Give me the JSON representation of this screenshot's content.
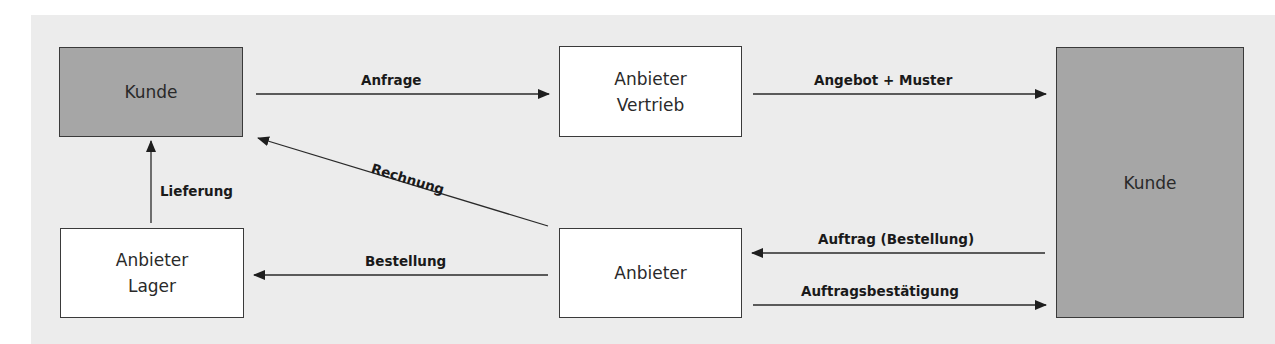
{
  "nodes": {
    "kunde_top_left": "Kunde",
    "anbieter_vertrieb": "Anbieter\nVertrieb",
    "kunde_right": "Kunde",
    "anbieter_lager": "Anbieter\nLager",
    "anbieter": "Anbieter"
  },
  "edges": {
    "anfrage": "Anfrage",
    "angebot_muster": "Angebot + Muster",
    "rechnung": "Rechnung",
    "lieferung": "Lieferung",
    "bestellung": "Bestellung",
    "auftrag": "Auftrag (Bestellung)",
    "auftragsbestaetigung": "Auftragsbestätigung"
  },
  "colors": {
    "panel": "#ececec",
    "customer_box": "#a6a6a6",
    "supplier_box": "#ffffff",
    "line": "#2a2a2a"
  }
}
